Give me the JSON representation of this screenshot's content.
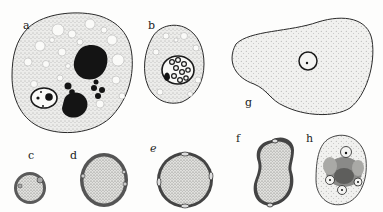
{
  "figure": {
    "labels": {
      "a": "a",
      "b": "b",
      "c": "c",
      "d": "d",
      "e": "e",
      "f": "f",
      "g": "g",
      "h": "h"
    },
    "colors": {
      "background": "#fdfdfc",
      "outline": "#2a2a2a",
      "cytoplasm": "#e9e9e6",
      "stipple": "#6a6a6a",
      "dark_mass": "#141414",
      "wall": "#555555"
    }
  }
}
